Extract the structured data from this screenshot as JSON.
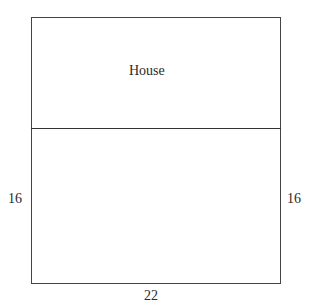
{
  "diagram": {
    "type": "rectangle-plot-diagram",
    "regions": [
      {
        "label": "House",
        "position": "top"
      },
      {
        "label": "",
        "position": "bottom"
      }
    ],
    "dimensions": {
      "left_side": "16",
      "right_side": "16",
      "bottom": "22"
    }
  }
}
